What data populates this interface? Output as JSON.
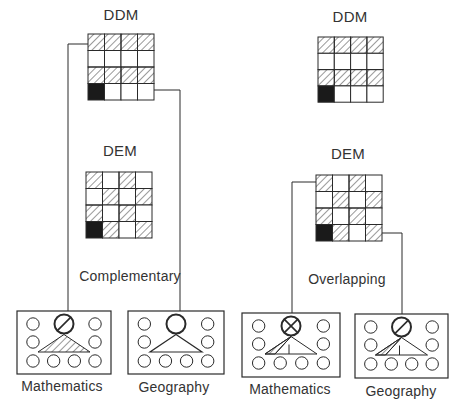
{
  "colors": {
    "ink": "#2a2a2a",
    "fill_black": "#1a1a1a",
    "hatch": "#333333",
    "paper": "#ffffff"
  },
  "cell_legend": {
    "H": "hatched",
    "W": "white",
    "B": "black"
  },
  "panels": [
    {
      "name": "complementary",
      "relation_label": "Complementary",
      "relation_label_pos": [
        130,
        276
      ],
      "ddm": {
        "label": "DDM",
        "label_pos": [
          121,
          14
        ],
        "grid_origin": [
          88,
          34
        ],
        "cell": 16.5,
        "rows": [
          [
            "H",
            "H",
            "H",
            "H"
          ],
          [
            "W",
            "W",
            "W",
            "W"
          ],
          [
            "H",
            "H",
            "H",
            "H"
          ],
          [
            "B",
            "W",
            "W",
            "W"
          ]
        ]
      },
      "dem": {
        "label": "DEM",
        "label_pos": [
          120,
          150
        ],
        "grid_origin": [
          86,
          172
        ],
        "cell": 16.5,
        "rows": [
          [
            "H",
            "W",
            "H",
            "W"
          ],
          [
            "W",
            "H",
            "W",
            "H"
          ],
          [
            "H",
            "W",
            "H",
            "W"
          ],
          [
            "B",
            "H",
            "W",
            "H"
          ]
        ]
      },
      "connectors": [
        {
          "from": "ddm",
          "points": [
            [
              88,
              44
            ],
            [
              68,
              44
            ],
            [
              68,
              320
            ]
          ]
        },
        {
          "from": "ddm",
          "points": [
            [
              154,
              90
            ],
            [
              180,
              90
            ],
            [
              180,
              320
            ]
          ]
        }
      ],
      "subjects": [
        {
          "name": "Mathematics",
          "box": [
            17,
            311,
            94,
            63
          ],
          "label_pos": [
            62,
            380
          ],
          "top_circle": "slash",
          "triangle": "full-hatch"
        },
        {
          "name": "Geography",
          "box": [
            128,
            311,
            96,
            63
          ],
          "label_pos": [
            174,
            381
          ],
          "top_circle": "plain",
          "triangle": "empty"
        }
      ]
    },
    {
      "name": "overlapping",
      "relation_label": "Overlapping",
      "relation_label_pos": [
        347,
        279
      ],
      "ddm": {
        "label": "DDM",
        "label_pos": [
          350,
          14
        ],
        "grid_origin": [
          318,
          37
        ],
        "cell": 16.3,
        "rows": [
          [
            "H",
            "H",
            "H",
            "H"
          ],
          [
            "W",
            "W",
            "W",
            "W"
          ],
          [
            "H",
            "H",
            "H",
            "H"
          ],
          [
            "B",
            "W",
            "W",
            "W"
          ]
        ]
      },
      "dem": {
        "label": "DEM",
        "label_pos": [
          348,
          153
        ],
        "grid_origin": [
          316,
          175
        ],
        "cell": 16.5,
        "rows": [
          [
            "H",
            "W",
            "H",
            "W"
          ],
          [
            "W",
            "H",
            "W",
            "H"
          ],
          [
            "H",
            "W",
            "H",
            "W"
          ],
          [
            "B",
            "H",
            "W",
            "H"
          ]
        ]
      },
      "connectors": [
        {
          "from": "dem",
          "points": [
            [
              316,
              182
            ],
            [
              292,
              182
            ],
            [
              292,
              322
            ]
          ]
        },
        {
          "from": "dem",
          "points": [
            [
              382,
              233
            ],
            [
              402,
              233
            ],
            [
              402,
              322
            ]
          ]
        }
      ],
      "subjects": [
        {
          "name": "Mathematics",
          "box": [
            242,
            313,
            98,
            64
          ],
          "label_pos": [
            290,
            383
          ],
          "top_circle": "cross",
          "triangle": "partial-hatch"
        },
        {
          "name": "Geography",
          "box": [
            355,
            314,
            93,
            64
          ],
          "label_pos": [
            401,
            385
          ],
          "top_circle": "slash",
          "triangle": "partial-hatch"
        }
      ]
    }
  ]
}
